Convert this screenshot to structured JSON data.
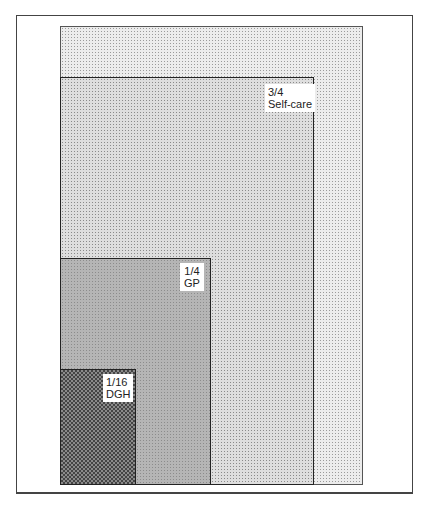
{
  "diagram": {
    "type": "nested-area-diagram",
    "levels": [
      {
        "id": "all",
        "fraction": "1",
        "label": "",
        "shade": "lightest dotted"
      },
      {
        "id": "self-care",
        "fraction": "3/4",
        "label": "Self-care",
        "shade": "light dotted"
      },
      {
        "id": "gp",
        "fraction": "1/4",
        "label": "GP",
        "shade": "medium grey"
      },
      {
        "id": "dgh",
        "fraction": "1/16",
        "label": "DGH",
        "shade": "dark checkered"
      }
    ]
  },
  "labels": {
    "self_care_fraction": "3/4",
    "self_care_name": "Self-care",
    "gp_fraction": "1/4",
    "gp_name": "GP",
    "dgh_fraction": "1/16",
    "dgh_name": "DGH"
  },
  "caption": ""
}
